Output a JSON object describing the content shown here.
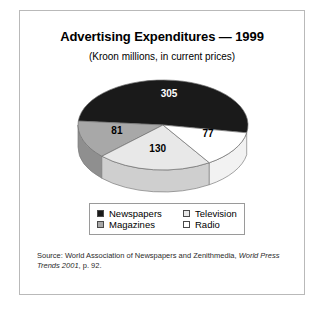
{
  "figure": {
    "title": "Advertising Expenditures — 1999",
    "subtitle": "(Kroon millions, in current prices)"
  },
  "source": {
    "prefix": "Source: World Association of Newspapers and Zenithmedia, ",
    "publication": "World Press Trends 2001",
    "suffix": ", p. 92."
  },
  "legend": {
    "items": [
      {
        "label": "Newspapers",
        "color": "#1a1a1a"
      },
      {
        "label": "Television",
        "color": "#e8e8e8"
      },
      {
        "label": "Magazines",
        "color": "#a8a8a8"
      },
      {
        "label": "Radio",
        "color": "#ffffff"
      }
    ]
  },
  "chart_data": {
    "type": "pie",
    "title": "Advertising Expenditures — 1999",
    "subtitle": "(Kroon millions, in current prices)",
    "unit": "Kroon millions, current prices",
    "year": 1999,
    "total": 593,
    "three_d": true,
    "legend_position": "bottom",
    "grid": false,
    "categories": [
      "Newspapers",
      "Magazines",
      "Television",
      "Radio"
    ],
    "values": [
      305,
      81,
      130,
      77
    ],
    "labels": [
      "305",
      "81",
      "130",
      "77"
    ],
    "colors": [
      "#1a1a1a",
      "#a8a8a8",
      "#e8e8e8",
      "#ffffff"
    ],
    "percentages": [
      51.4,
      13.7,
      21.9,
      13.0
    ],
    "slices": [
      {
        "name": "Newspapers",
        "value": 305,
        "label": "305",
        "color": "#1a1a1a",
        "side_color": "#141414",
        "start_deg": 185,
        "end_deg": 370
      },
      {
        "name": "Magazines",
        "value": 81,
        "label": "81",
        "color": "#a8a8a8",
        "side_color": "#8f8f8f",
        "start_deg": 136,
        "end_deg": 185
      },
      {
        "name": "Television",
        "value": 130,
        "label": "130",
        "color": "#e8e8e8",
        "side_color": "#cfcfcf",
        "start_deg": 57,
        "end_deg": 136
      },
      {
        "name": "Radio",
        "value": 77,
        "label": "77",
        "color": "#ffffff",
        "side_color": "#f2f2f2",
        "start_deg": 10,
        "end_deg": 57
      }
    ]
  }
}
